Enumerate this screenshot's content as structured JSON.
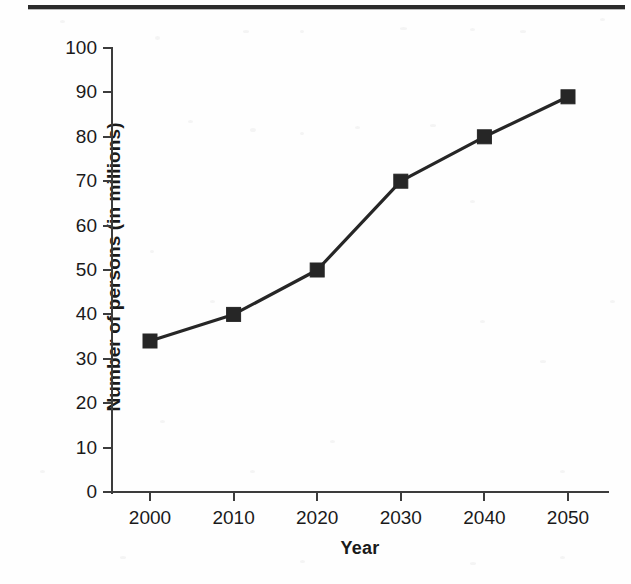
{
  "figure": {
    "top_rule": true,
    "background_color": "#fefefe",
    "line_color": "#262626",
    "axis_color": "#3c3c3c"
  },
  "chart_data": {
    "type": "line",
    "title": "",
    "subtitle": "",
    "xlabel": "Year",
    "ylabel": "Number of persons (in millions)",
    "x": [
      2000,
      2010,
      2020,
      2030,
      2040,
      2050
    ],
    "categories": [
      "2000",
      "2010",
      "2020",
      "2030",
      "2040",
      "2050"
    ],
    "values": [
      34,
      40,
      50,
      70,
      80,
      89
    ],
    "series": [
      {
        "name": "Number of persons",
        "values": [
          34,
          40,
          50,
          70,
          80,
          89
        ],
        "marker": "filled-square",
        "color": "#262626"
      }
    ],
    "xlim": [
      1995,
      2055
    ],
    "ylim": [
      0,
      100
    ],
    "yticks": [
      0,
      10,
      20,
      30,
      40,
      50,
      60,
      70,
      80,
      90,
      100
    ],
    "ytick_labels": [
      "0",
      "10",
      "20",
      "30",
      "40",
      "50",
      "60",
      "70",
      "80",
      "90",
      "100"
    ],
    "xticks": [
      2000,
      2010,
      2020,
      2030,
      2040,
      2050
    ],
    "xtick_labels": [
      "2000",
      "2010",
      "2020",
      "2030",
      "2040",
      "2050"
    ],
    "grid": false,
    "legend": false,
    "legend_position": "none"
  }
}
